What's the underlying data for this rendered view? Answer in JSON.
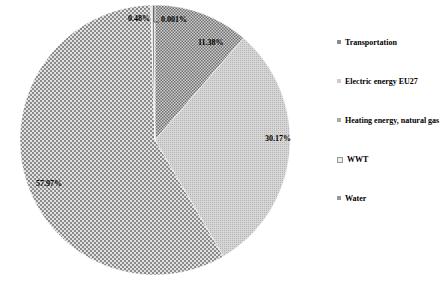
{
  "chart_data": {
    "type": "pie",
    "title": "",
    "categories": [
      "Transportation",
      "Electric energy EU27",
      "Heating energy, natural gas",
      "WWT",
      "Water"
    ],
    "values": [
      11.38,
      30.17,
      57.97,
      0.001,
      0.48
    ],
    "value_labels": [
      "11.38%",
      "30.17%",
      "57.97%",
      "0.001%",
      "0.48%"
    ],
    "start_angle": "12 o'clock, clockwise",
    "legend_position": "right",
    "patterns": [
      "fine dark checker",
      "light grey stipple",
      "medium checker",
      "white",
      "grey hatch"
    ]
  },
  "legend": {
    "items": [
      {
        "label": "Transportation"
      },
      {
        "label": "Electric energy EU27"
      },
      {
        "label": "Heating energy, natural gas"
      },
      {
        "label": "WWT"
      },
      {
        "label": "Water"
      }
    ]
  }
}
